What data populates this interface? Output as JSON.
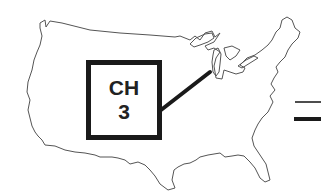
{
  "figure": {
    "callout": {
      "line1": "CH",
      "line2": "3",
      "points_to": "Chicago / southern Lake Michigan area"
    },
    "right_marks": [
      {
        "type": "thin-line"
      },
      {
        "type": "thick-line"
      }
    ]
  },
  "colors": {
    "outline": "#555555",
    "callout_border": "#1a1a1a",
    "text": "#222222",
    "background": "#ffffff"
  }
}
